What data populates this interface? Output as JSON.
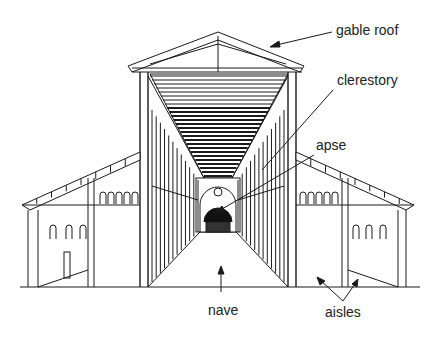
{
  "figure": {
    "labels": {
      "gable_roof": "gable roof",
      "clerestory": "clerestory",
      "apse": "apse",
      "nave": "nave",
      "aisles": "aisles"
    }
  },
  "colors": {
    "ink": "#1a1a1a",
    "paper": "#ffffff"
  }
}
